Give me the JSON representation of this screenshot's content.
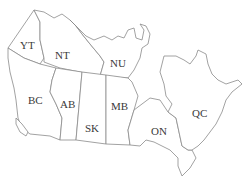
{
  "map": {
    "title": "Canada provinces and territories",
    "colors": {
      "fill": "#ffffff",
      "border": "#8a8a8a",
      "label": "#3a3a3a"
    },
    "regions": [
      {
        "code": "YT",
        "x": 20,
        "y": 40
      },
      {
        "code": "NT",
        "x": 55,
        "y": 50
      },
      {
        "code": "NU",
        "x": 110,
        "y": 58
      },
      {
        "code": "BC",
        "x": 28,
        "y": 95
      },
      {
        "code": "AB",
        "x": 60,
        "y": 99
      },
      {
        "code": "SK",
        "x": 85,
        "y": 123
      },
      {
        "code": "MB",
        "x": 113,
        "y": 101
      },
      {
        "code": "ON",
        "x": 152,
        "y": 126
      },
      {
        "code": "QC",
        "x": 193,
        "y": 108
      }
    ]
  }
}
